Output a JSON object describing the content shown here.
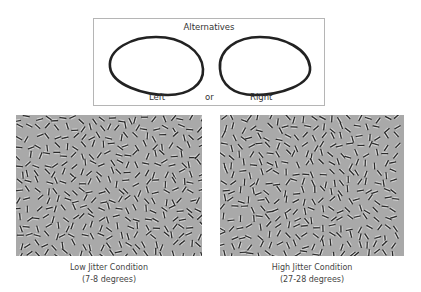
{
  "alternatives": {
    "title": "Alternatives",
    "left_label": "Left",
    "or_label": "or",
    "right_label": "Right",
    "left_shape": "egg-contour-pointing-left",
    "right_shape": "egg-contour-pointing-right"
  },
  "panels": [
    {
      "id": "low",
      "caption_line1": "Low Jitter Condition",
      "caption_line2": "(7-8 degrees)",
      "jitter_degrees": [
        7,
        8
      ],
      "stimulus": "gabor-field"
    },
    {
      "id": "high",
      "caption_line1": "High Jitter Condition",
      "caption_line2": "(27-28 degrees)",
      "jitter_degrees": [
        27,
        28
      ],
      "stimulus": "gabor-field"
    }
  ],
  "colors": {
    "background": "#ffffff",
    "panel_gray": "#a9a9a9",
    "contour": "#222222",
    "box_border": "#b5b5b5"
  }
}
